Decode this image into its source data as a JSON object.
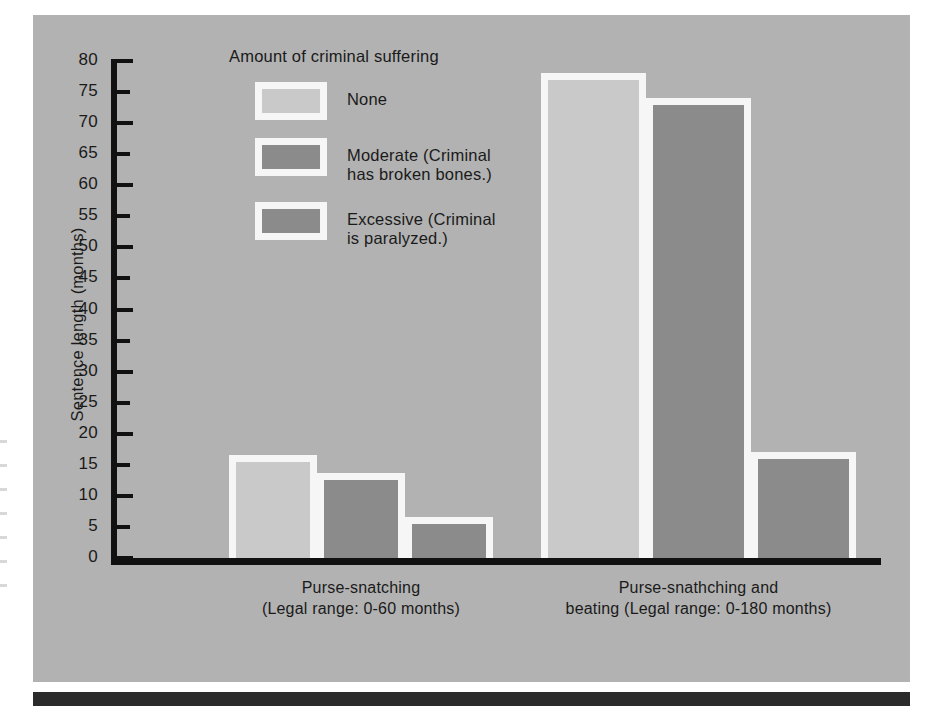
{
  "figure": {
    "background_color": "#b2b2b2",
    "axis_color": "#111111",
    "outline_color": "#f6f6f6"
  },
  "legend": {
    "title": "Amount of criminal suffering",
    "entries": [
      {
        "label_line1": "None",
        "label_line2": "",
        "color": "#c9c9c9",
        "key": "none"
      },
      {
        "label_line1": "Moderate (Criminal",
        "label_line2": "has broken bones.)",
        "color": "#8b8b8b",
        "key": "moderate"
      },
      {
        "label_line1": "Excessive (Criminal",
        "label_line2": "is paralyzed.)",
        "color": "#8b8b8b",
        "key": "excessive"
      }
    ]
  },
  "axis": {
    "y_title": "Sentence length (months)",
    "y_ticks": [
      80,
      75,
      70,
      65,
      60,
      55,
      50,
      45,
      40,
      35,
      30,
      25,
      20,
      15,
      10,
      5,
      0
    ]
  },
  "categories": [
    {
      "line1": "Purse-snatching",
      "line2": "(Legal range: 0-60 months)"
    },
    {
      "line1": "Purse-snathching and",
      "line2": "beating (Legal range: 0-180 months)"
    }
  ],
  "chart_data": {
    "type": "bar",
    "title": "",
    "subtitle": "",
    "xlabel": "",
    "ylabel": "Sentence length (months)",
    "ylim": [
      0,
      80
    ],
    "ytick_step": 5,
    "grid": false,
    "legend_position": "inside-top-left",
    "legend_title": "Amount of criminal suffering",
    "categories": [
      "Purse-snatching (Legal range: 0-60 months)",
      "Purse-snathching and beating (Legal range: 0-180 months)"
    ],
    "series": [
      {
        "name": "None",
        "color": "#c9c9c9",
        "values": [
          15.5,
          77
        ]
      },
      {
        "name": "Moderate (Criminal has broken bones.)",
        "color": "#8b8b8b",
        "values": [
          12.5,
          73
        ]
      },
      {
        "name": "Excessive (Criminal is paralyzed.)",
        "color": "#8b8b8b",
        "values": [
          5.5,
          16
        ]
      }
    ]
  }
}
